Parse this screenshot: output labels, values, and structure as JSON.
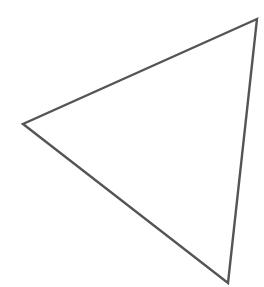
{
  "canvas": {
    "width": 264,
    "height": 287,
    "background": "#ffffff"
  },
  "shape": {
    "type": "triangle",
    "vertices": [
      {
        "x": 257,
        "y": 19
      },
      {
        "x": 23,
        "y": 124
      },
      {
        "x": 228,
        "y": 283
      }
    ],
    "stroke_color": "#555555",
    "stroke_width": 2.4,
    "fill": "none"
  }
}
